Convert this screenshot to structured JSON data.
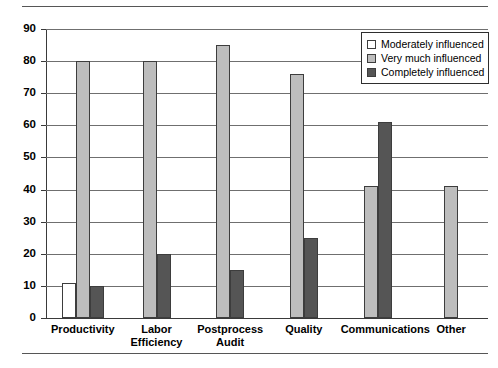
{
  "chart_data": {
    "type": "bar",
    "title": "",
    "xlabel": "",
    "ylabel": "",
    "ylim": [
      0,
      90
    ],
    "yticks": [
      0,
      10,
      20,
      30,
      40,
      50,
      60,
      70,
      80,
      90
    ],
    "ytick_labels": [
      "0",
      "10",
      "20",
      "30",
      "40",
      "50",
      "60",
      "70",
      "80",
      "90"
    ],
    "grid": true,
    "legend_position": "upper right",
    "categories": [
      "Productivity",
      "Labor\nEfficiency",
      "Postprocess\nAudit",
      "Quality",
      "Communications",
      "Other"
    ],
    "series": [
      {
        "name": "Moderately influenced",
        "color": "#ffffff",
        "values": [
          11,
          null,
          null,
          null,
          null,
          null
        ]
      },
      {
        "name": "Very much influenced",
        "color": "#bdbdbd",
        "values": [
          80,
          80,
          85,
          76,
          41,
          41
        ]
      },
      {
        "name": "Completely influenced",
        "color": "#555555",
        "values": [
          10,
          20,
          15,
          25,
          61,
          null
        ]
      }
    ]
  },
  "legend": {
    "items": [
      {
        "label": "Moderately influenced"
      },
      {
        "label": "Very much influenced"
      },
      {
        "label": "Completely influenced"
      }
    ]
  },
  "axis": {
    "y_labels": [
      "90",
      "80",
      "70",
      "60",
      "50",
      "40",
      "30",
      "20",
      "10",
      "0"
    ]
  },
  "colors": {
    "moderately": "#ffffff",
    "very_much": "#bdbdbd",
    "completely": "#555555",
    "gridline": "#6f6f6f",
    "axis": "#3a3a3a",
    "bar_outline": "#3d3d3d"
  }
}
